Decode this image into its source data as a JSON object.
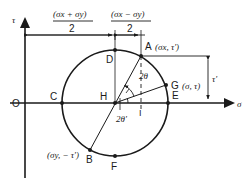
{
  "diagram": {
    "axes": {
      "vertical_label": "τ",
      "horizontal_label": "σ",
      "origin_label": "O"
    },
    "dimensions": {
      "left": {
        "numerator": "(σx + σy)",
        "denominator": "2"
      },
      "right": {
        "numerator": "(σx − σy)",
        "denominator": "2"
      },
      "tau_prime": "τ'"
    },
    "points": {
      "A": {
        "label": "A",
        "coords": "(σx, τ')"
      },
      "B": {
        "label": "B",
        "coords": "(σy, − τ')"
      },
      "C": {
        "label": "C"
      },
      "D": {
        "label": "D"
      },
      "E": {
        "label": "E"
      },
      "F": {
        "label": "F"
      },
      "G": {
        "label": "G",
        "coords": "(σ, τ)"
      },
      "H": {
        "label": "H"
      },
      "I": {
        "label": "I"
      }
    },
    "angles": {
      "two_theta": "2θ",
      "two_theta_prime": "2θ'"
    },
    "colors": {
      "ink": "#1a1a1a",
      "background": "#ffffff"
    }
  }
}
